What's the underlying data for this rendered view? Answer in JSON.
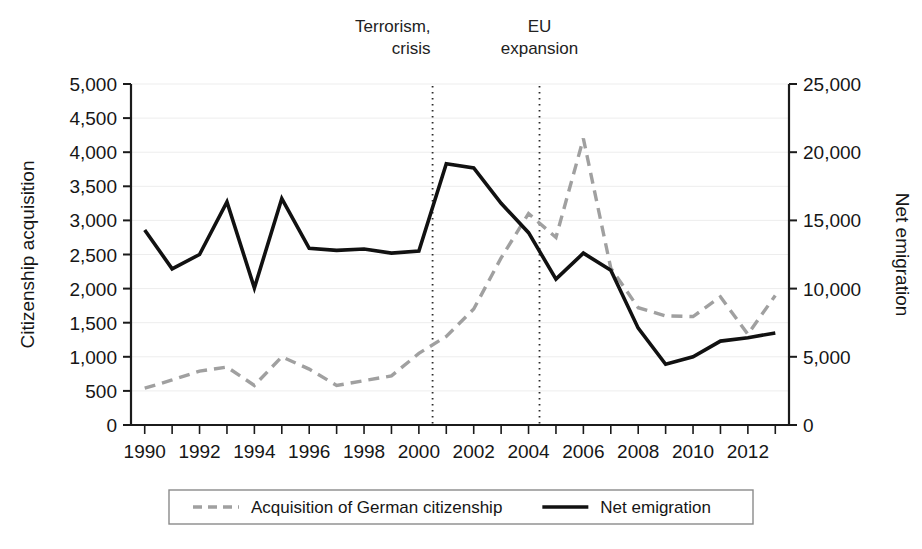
{
  "chart_data": {
    "type": "line",
    "title": "",
    "xlabel": "",
    "x": [
      1990,
      1991,
      1992,
      1993,
      1994,
      1995,
      1996,
      1997,
      1998,
      1999,
      2000,
      2001,
      2002,
      2003,
      2004,
      2005,
      2006,
      2007,
      2008,
      2009,
      2010,
      2011,
      2012,
      2013
    ],
    "xlim": [
      1989.5,
      2013.5
    ],
    "xticks_major": [
      1990,
      1992,
      1994,
      1996,
      1998,
      2000,
      2002,
      2004,
      2006,
      2008,
      2010,
      2012
    ],
    "xtick_labels": [
      "1990",
      "1992",
      "1994",
      "1996",
      "1998",
      "2000",
      "2002",
      "2004",
      "2006",
      "2008",
      "2010",
      "2012"
    ],
    "grid": true,
    "legend_position": "bottom",
    "axes": [
      {
        "id": "left",
        "ylabel": "Citizenship acquisition",
        "ylim": [
          0,
          5000
        ],
        "yticks": [
          0,
          500,
          1000,
          1500,
          2000,
          2500,
          3000,
          3500,
          4000,
          4500,
          5000
        ],
        "ytick_labels": [
          "0",
          "500",
          "1,000",
          "1,500",
          "2,000",
          "2,500",
          "3,000",
          "3,500",
          "4,000",
          "4,500",
          "5,000"
        ]
      },
      {
        "id": "right",
        "ylabel": "Net emigration",
        "ylim": [
          0,
          25000
        ],
        "yticks": [
          0,
          5000,
          10000,
          15000,
          20000,
          25000
        ],
        "ytick_labels": [
          "0",
          "5,000",
          "10,000",
          "15,000",
          "20,000",
          "25,000"
        ]
      }
    ],
    "series": [
      {
        "name": "Acquisition of German citizenship",
        "axis": "left",
        "style": "dashed",
        "color": "#a0a0a0",
        "values": [
          540,
          660,
          790,
          850,
          580,
          1000,
          820,
          580,
          650,
          720,
          1050,
          1300,
          1700,
          2450,
          3100,
          2750,
          4200,
          2300,
          1720,
          1600,
          1590,
          1880,
          1330,
          1900
        ]
      },
      {
        "name": "Net emigration",
        "axis": "right",
        "style": "solid",
        "color": "#111111",
        "values": [
          14300,
          11450,
          12500,
          16350,
          10050,
          16600,
          12950,
          12800,
          12900,
          12600,
          12750,
          19150,
          18850,
          16250,
          14100,
          10700,
          12600,
          11350,
          7100,
          4450,
          5000,
          6150,
          6400,
          6750
        ]
      }
    ],
    "annotations": [
      {
        "id": "terrorism-crisis",
        "text_line1": "Terrorism,",
        "text_line2": "crisis",
        "x": 2000.5,
        "align": "right"
      },
      {
        "id": "eu-expansion",
        "text_line1": "EU",
        "text_line2": "expansion",
        "x": 2004.4,
        "align": "center"
      }
    ]
  },
  "legend": {
    "items": [
      {
        "label": "Acquisition of German citizenship",
        "style": "dashed",
        "color": "#a0a0a0"
      },
      {
        "label": "Net emigration",
        "style": "solid",
        "color": "#111111"
      }
    ]
  }
}
